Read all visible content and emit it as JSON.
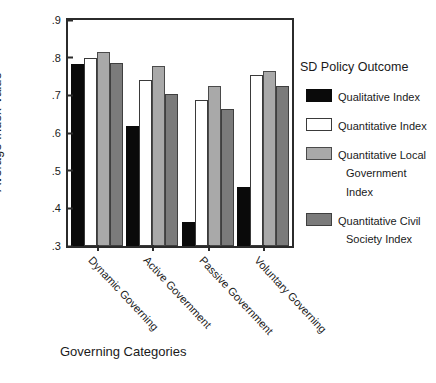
{
  "chart_data": {
    "type": "bar",
    "title": "",
    "xlabel": "Governing Categories",
    "ylabel": "Average Index Value",
    "ylim": [
      0.3,
      0.9
    ],
    "yticks": [
      ".9",
      ".8",
      ".7",
      ".6",
      ".5",
      ".4",
      ".3"
    ],
    "ytick_values": [
      0.9,
      0.8,
      0.7,
      0.6,
      0.5,
      0.4,
      0.3
    ],
    "grid": false,
    "legend_position": "right",
    "legend_title": "SD Policy Outcome",
    "categories": [
      "Dynamic Governing",
      "Active Government",
      "Passive Government",
      "Voluntary Governing"
    ],
    "series": [
      {
        "name": "Qualitative Index",
        "name_line1": "Qualitative Index",
        "name_line2": "",
        "color": "#0a0a0a",
        "values": [
          0.783,
          0.618,
          0.365,
          0.458
        ]
      },
      {
        "name": "Quantitative Index",
        "name_line1": "Quantitative Index",
        "name_line2": "",
        "color": "#ffffff",
        "values": [
          0.8,
          0.742,
          0.688,
          0.753
        ]
      },
      {
        "name": "Quantitative Local Government Index",
        "name_line1": "Quantitative Local",
        "name_line2": "Government Index",
        "color": "#a9a9a9",
        "values": [
          0.814,
          0.778,
          0.725,
          0.765
        ]
      },
      {
        "name": "Quantitative Civil Society Index",
        "name_line1": "Quantitative Civil",
        "name_line2": "Society Index",
        "color": "#7b7b7b",
        "values": [
          0.785,
          0.703,
          0.665,
          0.725
        ]
      }
    ]
  }
}
